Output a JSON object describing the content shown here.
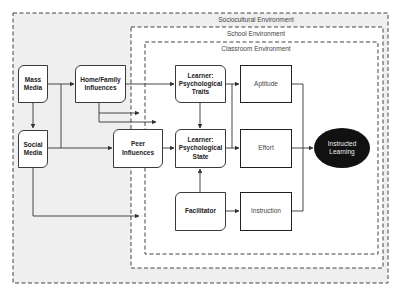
{
  "environments": {
    "sociocultural": {
      "label": "Sociocultural Environment",
      "fill": "#efefef"
    },
    "school": {
      "label": "School Environment",
      "fill": "#ffffff"
    },
    "classroom": {
      "label": "Classroom Environment",
      "fill": "#ffffff"
    }
  },
  "nodes": {
    "mass_media": {
      "line1": "Mass",
      "line2": "Media"
    },
    "social_media": {
      "line1": "Social",
      "line2": "Media"
    },
    "home_family": {
      "line1": "Home/Family",
      "line2": "Influences"
    },
    "peer": {
      "line1": "Peer",
      "line2": "Influences"
    },
    "traits": {
      "line1": "Learner:",
      "line2": "Psychological",
      "line3": "Traits"
    },
    "state": {
      "line1": "Learner:",
      "line2": "Psychological",
      "line3": "State"
    },
    "facilitator": {
      "line1": "Facilitator"
    },
    "aptitude": {
      "line1": "Aptitude"
    },
    "effort": {
      "line1": "Effort"
    },
    "instruction": {
      "line1": "Instruction"
    },
    "instructed_learning": {
      "line1": "Instructed",
      "line2": "Learning"
    }
  },
  "colors": {
    "line": "#333333",
    "ellipse_fill": "#111111",
    "dash": "#444444"
  }
}
